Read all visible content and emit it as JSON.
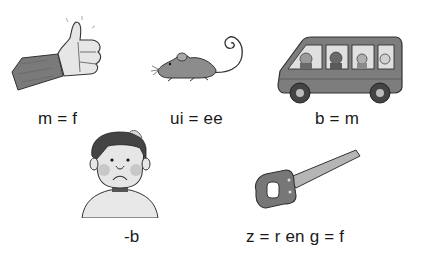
{
  "worksheet": {
    "items": [
      {
        "picture": "thumb-up",
        "rule": "m = f"
      },
      {
        "picture": "mouse",
        "rule": "ui = ee"
      },
      {
        "picture": "bus",
        "rule": "b = m"
      },
      {
        "picture": "sad-boy",
        "rule": "-b"
      },
      {
        "picture": "saw",
        "rule": "z = r en g = f"
      }
    ]
  },
  "colors": {
    "ink": "#1a1a1a",
    "sleeve": "#7a7a7a",
    "skin": "#e6e6e6",
    "body_gray": "#8c8c8c",
    "dark_gray": "#5a5a5a",
    "light_gray": "#d9d9d9"
  }
}
